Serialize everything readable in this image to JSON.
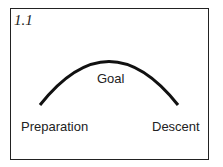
{
  "figure": {
    "number": "1.1",
    "labels": {
      "peak": "Goal",
      "start": "Preparation",
      "end": "Descent"
    },
    "arc": {
      "start": [
        40,
        105
      ],
      "peak": [
        112,
        61
      ],
      "end": [
        178,
        105
      ],
      "color": "#111111"
    }
  }
}
